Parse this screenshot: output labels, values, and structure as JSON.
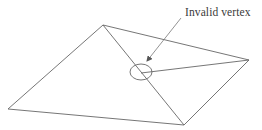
{
  "diagram": {
    "annotation": {
      "label": "Invalid vertex",
      "arrow_from": [
        181,
        18
      ],
      "arrow_to": [
        147,
        61
      ]
    },
    "vertices": {
      "top": [
        103,
        25
      ],
      "right": [
        249,
        60
      ],
      "left": [
        8,
        109
      ],
      "bottom": [
        184,
        125
      ],
      "invalid": [
        141,
        73
      ]
    },
    "edges": [
      [
        "top",
        "right"
      ],
      [
        "right",
        "invalid"
      ],
      [
        "top",
        "left"
      ],
      [
        "left",
        "bottom"
      ],
      [
        "top",
        "bottom"
      ],
      [
        "bottom",
        "right"
      ]
    ],
    "highlight_circle": {
      "cx": 141,
      "cy": 72,
      "rx": 11,
      "ry": 8
    },
    "colors": {
      "line": "#555555",
      "text": "#3a3a3a",
      "background": "#ffffff"
    }
  }
}
